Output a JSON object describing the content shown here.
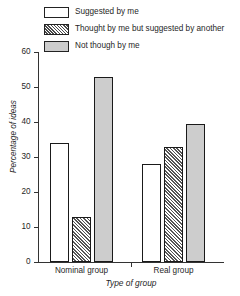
{
  "chart_data": {
    "type": "bar",
    "title": "",
    "xlabel": "Type of group",
    "ylabel": "Percentage of ideas",
    "categories": [
      "Nominal group",
      "Real group"
    ],
    "series": [
      {
        "name": "Suggested by me",
        "values": [
          34,
          28
        ],
        "fill": "open"
      },
      {
        "name": "Thought by me but suggested by another",
        "values": [
          13,
          33
        ],
        "fill": "hatched"
      },
      {
        "name": "Not though by me",
        "values": [
          53,
          39.5
        ],
        "fill": "solid"
      }
    ],
    "ylim": [
      0,
      60
    ],
    "yticks": [
      0,
      10,
      20,
      30,
      40,
      50,
      60
    ],
    "ytick_labels": [
      "0",
      "10",
      "20",
      "30",
      "40",
      "50",
      "60"
    ],
    "grid": false,
    "legend_position": "top"
  },
  "legend": {
    "items": [
      {
        "label": "Suggested by me",
        "swatch": "open-square-swatch"
      },
      {
        "label": "Thought by me but suggested by another",
        "swatch": "hatched-square-swatch"
      },
      {
        "label": "Not though by me",
        "swatch": "gray-square-swatch"
      }
    ]
  },
  "colors": {
    "open_fill": "#ffffff",
    "hatch_fill": "#efefef",
    "solid_fill": "#cdcdcd",
    "outline": "#1a1a1a",
    "axis": "#333333",
    "text": "#1f1f1f",
    "background": "#ffffff"
  }
}
